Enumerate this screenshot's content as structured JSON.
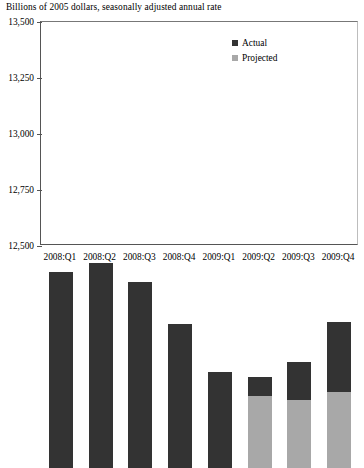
{
  "chart_data": {
    "type": "bar",
    "title": "Billions of 2005 dollars, seasonally adjusted annual rate",
    "xlabel": "",
    "ylabel": "",
    "ylim": [
      12500,
      13500
    ],
    "ytick_values": [
      12500,
      12750,
      13000,
      13250,
      13500
    ],
    "ytick_labels": [
      "12,500",
      "12,750",
      "13,000",
      "13,250",
      "13,500"
    ],
    "grid": false,
    "stacked": true,
    "legend_position": "top-right",
    "categories": [
      "2008:Q1",
      "2008:Q2",
      "2008:Q3",
      "2008:Q4",
      "2009:Q1",
      "2009:Q2",
      "2009:Q3",
      "2009:Q4"
    ],
    "series": [
      {
        "name": "Actual",
        "color": "#333333",
        "values": [
          13375,
          13415,
          13330,
          13145,
          12930,
          12905,
          12975,
          13150
        ]
      },
      {
        "name": "Projected",
        "color": "#a8a8a8",
        "values": [
          null,
          null,
          null,
          null,
          null,
          12820,
          12805,
          12840
        ]
      }
    ],
    "legend": [
      {
        "label": "Actual",
        "color": "#333333"
      },
      {
        "label": "Projected",
        "color": "#a8a8a8"
      }
    ]
  },
  "colors": {
    "actual": "#333333",
    "projected": "#a8a8a8",
    "axis": "#555555",
    "background": "#ffffff",
    "text": "#000000"
  }
}
